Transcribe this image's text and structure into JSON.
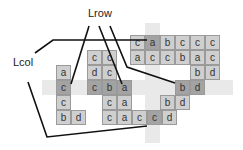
{
  "labels": {
    "row_label": "Lrow",
    "col_label": "Lcol"
  },
  "colors": {
    "cell_fill": "#cfcfcf",
    "cell_dark_fill": "#a3a3a3",
    "cell_border": "#9a9a9a",
    "highlight_band": "#e9e9e9",
    "line": "#111111"
  },
  "cell_size": 15,
  "highlight_bands": [
    {
      "name": "row-band",
      "x": 42,
      "y": 80,
      "w": 191,
      "h": 15
    },
    {
      "name": "col-band",
      "x": 145,
      "y": 23,
      "w": 15,
      "h": 120
    }
  ],
  "cells": [
    {
      "x": 130,
      "y": 35,
      "t": "c",
      "dark": false
    },
    {
      "x": 145,
      "y": 35,
      "t": "a",
      "dark": true
    },
    {
      "x": 160,
      "y": 35,
      "t": "b",
      "dark": false
    },
    {
      "x": 175,
      "y": 35,
      "t": "c",
      "dark": false
    },
    {
      "x": 190,
      "y": 35,
      "t": "c",
      "dark": false
    },
    {
      "x": 205,
      "y": 35,
      "t": "c",
      "dark": false
    },
    {
      "x": 130,
      "y": 50,
      "t": "a",
      "dark": false
    },
    {
      "x": 145,
      "y": 50,
      "t": "c",
      "dark": false
    },
    {
      "x": 160,
      "y": 50,
      "t": "c",
      "dark": false
    },
    {
      "x": 175,
      "y": 50,
      "t": "b",
      "dark": false
    },
    {
      "x": 190,
      "y": 50,
      "t": "a",
      "dark": false
    },
    {
      "x": 205,
      "y": 50,
      "t": "c",
      "dark": false
    },
    {
      "x": 190,
      "y": 65,
      "t": "b",
      "dark": false
    },
    {
      "x": 205,
      "y": 65,
      "t": "d",
      "dark": false
    },
    {
      "x": 87,
      "y": 50,
      "t": "c",
      "dark": false
    },
    {
      "x": 102,
      "y": 50,
      "t": "c",
      "dark": false
    },
    {
      "x": 56,
      "y": 65,
      "t": "a",
      "dark": false
    },
    {
      "x": 87,
      "y": 65,
      "t": "d",
      "dark": false
    },
    {
      "x": 102,
      "y": 65,
      "t": "c",
      "dark": false
    },
    {
      "x": 56,
      "y": 80,
      "t": "c",
      "dark": true
    },
    {
      "x": 87,
      "y": 80,
      "t": "c",
      "dark": true
    },
    {
      "x": 102,
      "y": 80,
      "t": "b",
      "dark": true
    },
    {
      "x": 117,
      "y": 80,
      "t": "a",
      "dark": true
    },
    {
      "x": 175,
      "y": 80,
      "t": "b",
      "dark": true
    },
    {
      "x": 190,
      "y": 80,
      "t": "d",
      "dark": true
    },
    {
      "x": 56,
      "y": 95,
      "t": "c",
      "dark": false
    },
    {
      "x": 102,
      "y": 95,
      "t": "c",
      "dark": false
    },
    {
      "x": 117,
      "y": 95,
      "t": "a",
      "dark": false
    },
    {
      "x": 160,
      "y": 95,
      "t": "b",
      "dark": false
    },
    {
      "x": 175,
      "y": 95,
      "t": "d",
      "dark": false
    },
    {
      "x": 56,
      "y": 110,
      "t": "b",
      "dark": false
    },
    {
      "x": 71,
      "y": 110,
      "t": "d",
      "dark": false
    },
    {
      "x": 102,
      "y": 110,
      "t": "c",
      "dark": false
    },
    {
      "x": 117,
      "y": 110,
      "t": "a",
      "dark": false
    },
    {
      "x": 132,
      "y": 110,
      "t": "c",
      "dark": false
    },
    {
      "x": 147,
      "y": 110,
      "t": "c",
      "dark": true
    },
    {
      "x": 162,
      "y": 110,
      "t": "d",
      "dark": false
    }
  ],
  "lines": [
    {
      "name": "lrow-pointer-1",
      "points": "89,26 71,84"
    },
    {
      "name": "lrow-pointer-2",
      "points": "99,26 122,84"
    },
    {
      "name": "lrow-pointer-3",
      "points": "110,26 127,67 175,83"
    },
    {
      "name": "lcol-pointer-1",
      "points": "35,53 53,40 147,40"
    },
    {
      "name": "lcol-pointer-2",
      "points": "28,82 47,137 147,126"
    }
  ]
}
